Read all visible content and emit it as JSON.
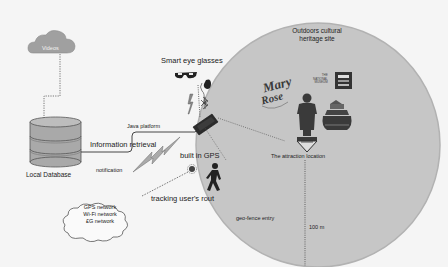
{
  "diagram": {
    "site": {
      "title_line1": "Outdoors cultural",
      "title_line2": "heritage site",
      "attraction_label": "The attraction location",
      "geofence_label": "geo-fence entry",
      "radius_label": "100 m",
      "landmarks": [
        "mary-rose-logo-icon",
        "national-museum-logo-icon",
        "statue-icon",
        "ship-museum-icon"
      ]
    },
    "cloud_videos": {
      "label": "Videos"
    },
    "database": {
      "label": "Local Database"
    },
    "glasses": {
      "label": "Smart eye glasses"
    },
    "connections": {
      "java": "Java platform",
      "info": "Information retrieval",
      "notification": "notification",
      "gps": "built in GPS",
      "tracking": "tracking user's rout"
    },
    "network_cloud": {
      "line1": "GPS network",
      "line2": "Wi-Fi network",
      "line3": "£G network"
    },
    "colors": {
      "circle_fill": "#c4c4c4",
      "circle_stroke": "#b0b0b0",
      "cloud_fill": "#9a9a9a",
      "db_fill": "#a8a8a8",
      "phone": "#2a2a2a",
      "background": "#f5f5f5"
    }
  }
}
